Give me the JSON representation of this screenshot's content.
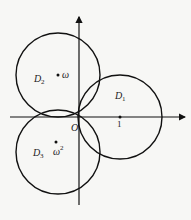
{
  "diagram": {
    "type": "complex-plane-disks",
    "origin_label": "O",
    "unit_label": "1",
    "disks": [
      {
        "name": "D",
        "sub": "1",
        "center_label": "",
        "center": [
          1,
          0
        ],
        "radius": 1
      },
      {
        "name": "D",
        "sub": "2",
        "center_label": "ω",
        "center": [
          -0.5,
          0.866
        ],
        "radius": 1
      },
      {
        "name": "D",
        "sub": "3",
        "center_label": "ω",
        "center_sup": "2",
        "center": [
          -0.5,
          -0.866
        ],
        "radius": 1
      }
    ]
  },
  "colors": {
    "stroke": "#111111",
    "background": "#f7f7f5"
  }
}
